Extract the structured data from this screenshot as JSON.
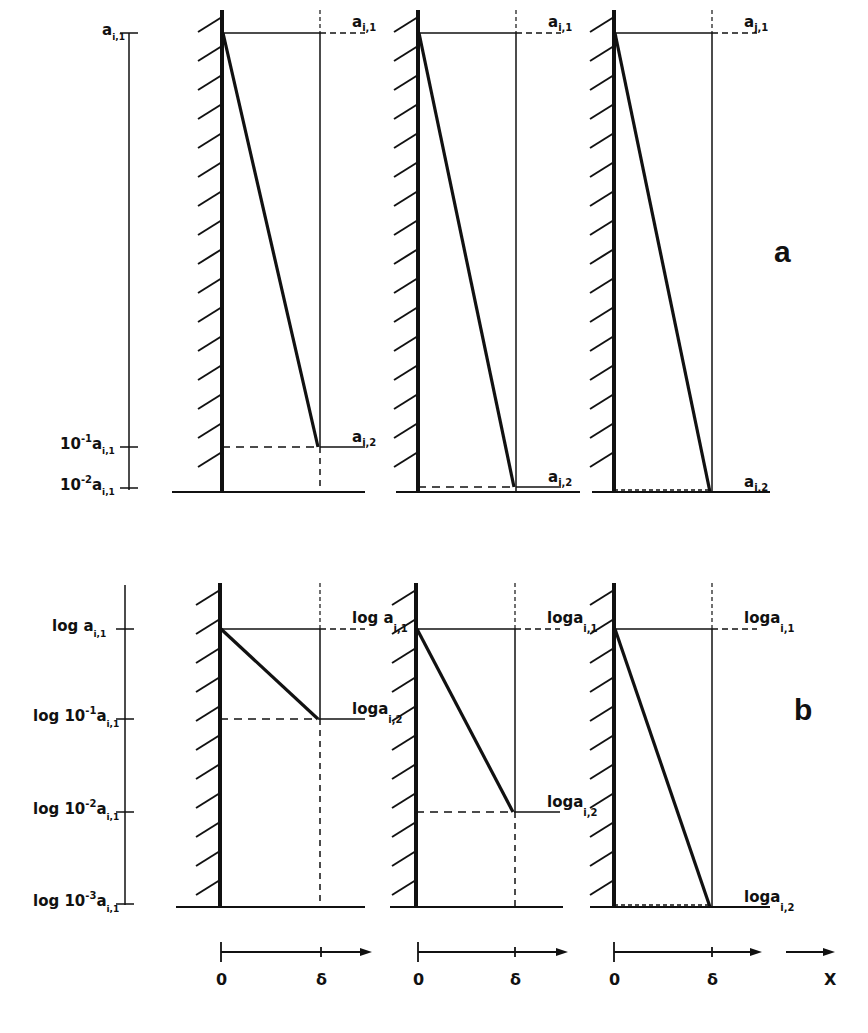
{
  "figure": {
    "ink_color": "#111111",
    "background": "#ffffff",
    "panel_a": {
      "label": "a",
      "label_pos": [
        774,
        262
      ],
      "scale": "linear",
      "axis": {
        "x": 129,
        "top": 33,
        "bottom": 490,
        "ticks": [
          {
            "y": 33,
            "base": "a",
            "sub": "i,1",
            "prefix": ""
          },
          {
            "y": 447,
            "base": "a",
            "sub": "i,1",
            "prefix": "10",
            "exp": "-1"
          },
          {
            "y": 488,
            "base": "a",
            "sub": "i,1",
            "prefix": "10",
            "exp": "-2"
          }
        ]
      },
      "subplots": [
        {
          "wall_x": 222,
          "delta_x": 320,
          "y_top": 33,
          "y_end": 447,
          "floor_y": 492,
          "floor_x1": 172,
          "floor_x2": 365,
          "label_top": {
            "base": "a",
            "sub": "i,1"
          },
          "label_end": {
            "base": "a",
            "sub": "i,2"
          },
          "ratio": "10^-1"
        },
        {
          "wall_x": 418,
          "delta_x": 516,
          "y_top": 33,
          "y_end": 487,
          "floor_y": 492,
          "floor_x1": 396,
          "floor_x2": 580,
          "label_top": {
            "base": "a",
            "sub": "i,1"
          },
          "label_end": {
            "base": "a",
            "sub": "i,2"
          },
          "ratio": "10^-2"
        },
        {
          "wall_x": 614,
          "delta_x": 712,
          "y_top": 33,
          "y_end": 492,
          "floor_y": 492,
          "floor_x1": 592,
          "floor_x2": 770,
          "label_top": {
            "base": "a",
            "sub": "j,1"
          },
          "label_end": {
            "base": "a",
            "sub": "j,2"
          },
          "ratio": "<10^-2"
        }
      ]
    },
    "panel_b": {
      "label": "b",
      "label_pos": [
        794,
        720
      ],
      "scale": "logarithmic",
      "axis": {
        "x": 125,
        "top": 585,
        "bottom": 905,
        "ticks": [
          {
            "y": 629,
            "text": "log a",
            "sub": "i,1"
          },
          {
            "y": 719,
            "text": "log 10",
            "exp": "-1",
            "tail": "a",
            "sub": "i,1"
          },
          {
            "y": 812,
            "text": "log 10",
            "exp": "-2",
            "tail": "a",
            "sub": "i,1"
          },
          {
            "y": 904,
            "text": "log 10",
            "exp": "-3",
            "tail": "a",
            "sub": "i,1"
          }
        ]
      },
      "subplots": [
        {
          "wall_x": 220,
          "delta_x": 320,
          "y_top": 629,
          "y_end": 719,
          "floor_y": 907,
          "floor_x1": 176,
          "floor_x2": 365,
          "label_top": {
            "text": "log a",
            "sub": "i,1"
          },
          "label_end": {
            "text": "loga",
            "sub": "i,2"
          }
        },
        {
          "wall_x": 416,
          "delta_x": 515,
          "y_top": 629,
          "y_end": 812,
          "floor_y": 907,
          "floor_x1": 390,
          "floor_x2": 563,
          "label_top": {
            "text": "loga",
            "sub": "i,1"
          },
          "label_end": {
            "text": "loga",
            "sub": "i,2"
          }
        },
        {
          "wall_x": 614,
          "delta_x": 712,
          "y_top": 629,
          "y_end": 907,
          "floor_y": 907,
          "floor_x1": 590,
          "floor_x2": 770,
          "label_top": {
            "text": "loga",
            "sub": "i,1"
          },
          "label_end": {
            "text": "loga",
            "sub": "i,2"
          }
        }
      ]
    },
    "x_axes": {
      "y": 952,
      "label_y": 985,
      "segments": [
        {
          "x0": 221,
          "xd": 321,
          "x_end": 372,
          "origin_label": "0",
          "delta_label": "δ"
        },
        {
          "x0": 418,
          "xd": 515,
          "x_end": 568,
          "origin_label": "0",
          "delta_label": "δ"
        },
        {
          "x0": 614,
          "xd": 712,
          "x_end": 762,
          "origin_label": "0",
          "delta_label": "δ"
        }
      ],
      "x_arrow": {
        "x1": 786,
        "x2": 835,
        "label": "X",
        "label_x": 829
      }
    }
  }
}
